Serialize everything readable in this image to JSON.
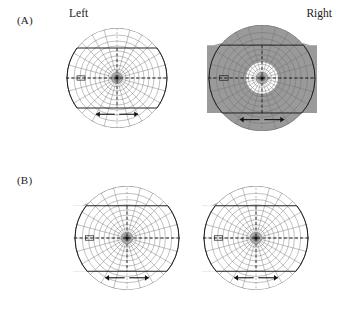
{
  "figure": {
    "title_visible": false,
    "background_color": "#ffffff",
    "gray_fill": "#9a9a9a",
    "grid_line_color": "#6f6f6f",
    "outline_color": "#222222"
  },
  "panels": [
    {
      "id": "A",
      "label": "(A)",
      "headers": {
        "left": "Left",
        "right": "Right"
      },
      "eyes": [
        {
          "id": "a-left",
          "side": "left",
          "shading": "none",
          "description": "unshaded visual field chart",
          "center_mark": "fixation-point",
          "arrows": 2
        },
        {
          "id": "a-right",
          "side": "right",
          "shading": "peripheral",
          "description": "peripheral field shaded, central island spared",
          "center_mark": "fixation-point",
          "arrows": 2
        }
      ]
    },
    {
      "id": "B",
      "label": "(B)",
      "headers": {
        "left": "",
        "right": ""
      },
      "eyes": [
        {
          "id": "b-left",
          "side": "left",
          "shading": "left-hemifield",
          "description": "left hemifield shaded with macular sparing",
          "center_mark": "fixation-point",
          "arrows": 2
        },
        {
          "id": "b-right",
          "side": "right",
          "shading": "left-hemifield",
          "description": "left hemifield shaded with macular sparing",
          "center_mark": "fixation-point",
          "arrows": 2
        }
      ]
    }
  ],
  "chart_data": {
    "type": "polar-grid",
    "title": "",
    "xlabel": "",
    "ylabel": "",
    "grid": true,
    "legend_position": "none",
    "meridian_count": 24,
    "isopter_ring_count": 11,
    "ring_radii_fraction": [
      0.05,
      0.11,
      0.18,
      0.26,
      0.35,
      0.44,
      0.54,
      0.64,
      0.74,
      0.86,
      1.0
    ],
    "features": [
      "horizontal dashed meridian",
      "vertical dashed meridian",
      "flat superior chart border",
      "flat inferior chart border",
      "blind-spot notch on horizontal meridian",
      "paired outward-pointing arrows at inferior border"
    ]
  }
}
